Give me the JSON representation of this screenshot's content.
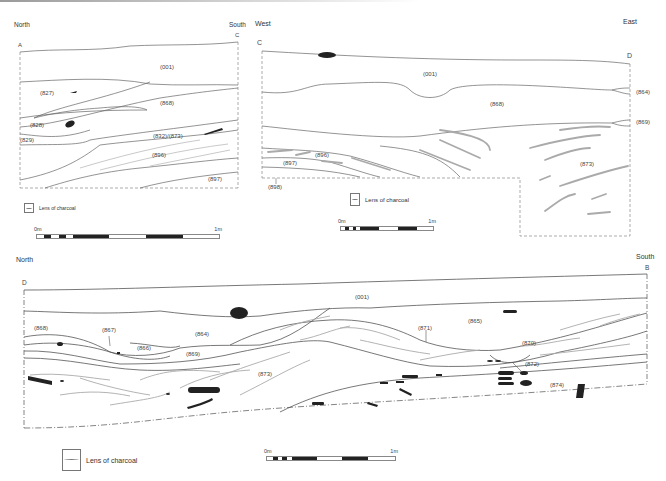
{
  "figure": {
    "colors": {
      "line": "#555555",
      "charcoal": "#222222",
      "lens": "#aaaaaa",
      "limit": "#666666"
    }
  },
  "section_ac": {
    "orientation_left": "North",
    "orientation_right": "South",
    "point_left": "A",
    "point_right": "C",
    "contexts": [
      "(001)",
      "(827)",
      "(868)",
      "(828)",
      "(829)",
      "(832)/(873)",
      "(896)",
      "(897)"
    ],
    "legend": "Lens of charcoal",
    "scale": {
      "start": "0m",
      "end": "1m"
    }
  },
  "section_cd": {
    "orientation_left": "West",
    "orientation_right": "East",
    "point_left": "C",
    "point_right": "D",
    "contexts": [
      "(001)",
      "(868)",
      "(864)",
      "(869)",
      "(896)",
      "(897)",
      "(898)",
      "(873)"
    ],
    "legend": "Lens of charcoal",
    "scale": {
      "start": "0m",
      "end": "1m"
    }
  },
  "section_db": {
    "orientation_left": "North",
    "orientation_right": "South",
    "point_left": "D",
    "point_right": "B",
    "contexts": [
      "(001)",
      "(868)",
      "(867)",
      "(866)",
      "(864)",
      "(869)",
      "(871)",
      "(865)",
      "(870)",
      "(872)",
      "(873)",
      "(874)"
    ],
    "legend": "Lens of charcoal",
    "scale": {
      "start": "0m",
      "end": "1m"
    }
  }
}
